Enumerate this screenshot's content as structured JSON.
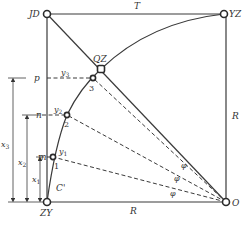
{
  "diagram": {
    "corner_labels": {
      "jd": "JD",
      "yz": "YZ",
      "zy": "ZY",
      "o": "O",
      "qz": "QZ"
    },
    "edge_labels": {
      "tangent_top": "T",
      "radius_right": "R",
      "radius_bottom": "R"
    },
    "curve_label": "C'",
    "points": [
      {
        "id": "1",
        "label": "1",
        "offset_label": "y",
        "offset_sub": "1",
        "axis_label": "m"
      },
      {
        "id": "2",
        "label": "2",
        "offset_label": "y",
        "offset_sub": "2",
        "axis_label": "n"
      },
      {
        "id": "3",
        "label": "3",
        "offset_label": "y",
        "offset_sub": "3",
        "axis_label": "p"
      }
    ],
    "dimensions": [
      {
        "label": "x",
        "sub": "1"
      },
      {
        "label": "x",
        "sub": "2"
      },
      {
        "label": "x",
        "sub": "3"
      }
    ],
    "angle_labels": [
      "φ",
      "φ",
      "φ"
    ]
  }
}
